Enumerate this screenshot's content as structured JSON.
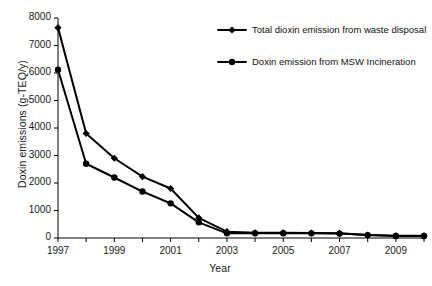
{
  "chart_data": {
    "type": "line",
    "title": "",
    "xlabel": "Year",
    "ylabel": "Doxin emissions (g-TEQ/y)",
    "xlim": [
      1997,
      2010
    ],
    "ylim": [
      0,
      8000
    ],
    "grid": false,
    "legend_position": "upper-right-inside",
    "x": [
      1997,
      1998,
      1999,
      2000,
      2001,
      2002,
      2003,
      2004,
      2005,
      2006,
      2007,
      2008,
      2009,
      2010
    ],
    "x_tick_labels": [
      "1997",
      "1999",
      "2001",
      "2003",
      "2005",
      "2007",
      "2009"
    ],
    "x_tick_values": [
      1997,
      1999,
      2001,
      2003,
      2005,
      2007,
      2009
    ],
    "y_tick_labels": [
      "0",
      "1000",
      "2000",
      "3000",
      "4000",
      "5000",
      "6000",
      "7000",
      "8000"
    ],
    "y_tick_values": [
      0,
      1000,
      2000,
      3000,
      4000,
      5000,
      6000,
      7000,
      8000
    ],
    "series": [
      {
        "name": "Total dioxin emission from waste disposal",
        "marker": "diamond",
        "color": "#000000",
        "values": [
          7650,
          3800,
          2900,
          2230,
          1800,
          730,
          230,
          190,
          190,
          180,
          170,
          110,
          80,
          80
        ]
      },
      {
        "name": "Doxin emission from MSW Incineration",
        "marker": "circle",
        "color": "#000000",
        "values": [
          6120,
          2700,
          2200,
          1690,
          1260,
          570,
          170,
          175,
          175,
          170,
          160,
          105,
          75,
          75
        ]
      }
    ]
  },
  "legend": {
    "items": [
      {
        "label": "Total dioxin emission from waste disposal",
        "marker": "diamond"
      },
      {
        "label": "Doxin emission from MSW Incineration",
        "marker": "circle"
      }
    ]
  },
  "axes": {
    "x_title": "Year",
    "y_title": "Doxin emissions (g-TEQ/y)"
  }
}
